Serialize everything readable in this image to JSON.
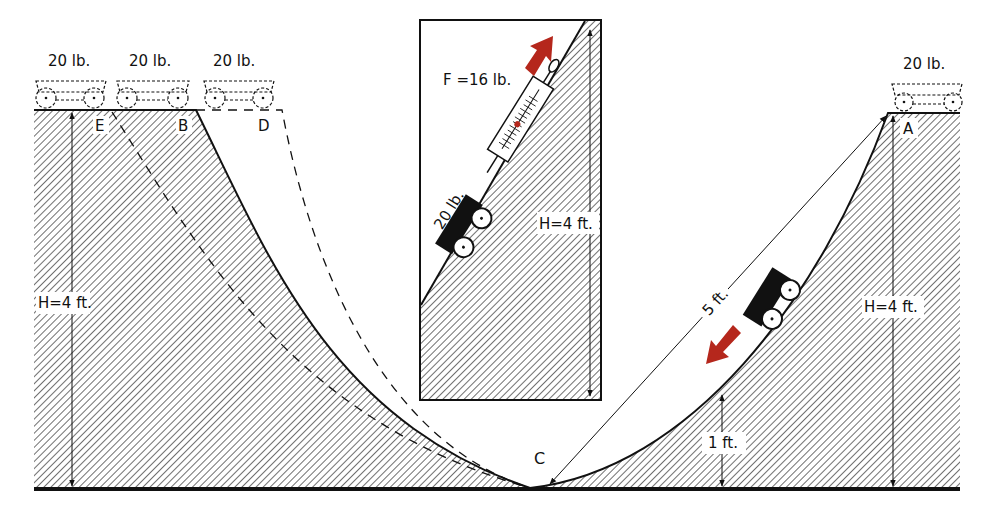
{
  "diagram": {
    "colors": {
      "ink": "#111111",
      "hatch_bg": "#ffffff",
      "arrow_red": "#b5271c",
      "background": "#ffffff"
    },
    "left_section": {
      "carts": [
        {
          "id": "E",
          "weight_label": "20 lb."
        },
        {
          "id": "B",
          "weight_label": "20 lb."
        },
        {
          "id": "D",
          "weight_label": "20 lb."
        }
      ],
      "point_labels": {
        "E": "E",
        "B": "B",
        "D": "D"
      },
      "height_label": "H=4 ft."
    },
    "bottom": {
      "point_label": "C"
    },
    "right_section": {
      "cart_top": {
        "id": "A",
        "weight_label": "20 lb."
      },
      "point_label": "A",
      "height_label": "H=4 ft.",
      "slant_label": "5 ft.",
      "low_height_label": "1 ft."
    },
    "inset": {
      "force_label": "F =16 lb.",
      "cart_weight_label": "20 lb.",
      "height_label": "H=4 ft.",
      "instrument": "spring-scale"
    }
  }
}
